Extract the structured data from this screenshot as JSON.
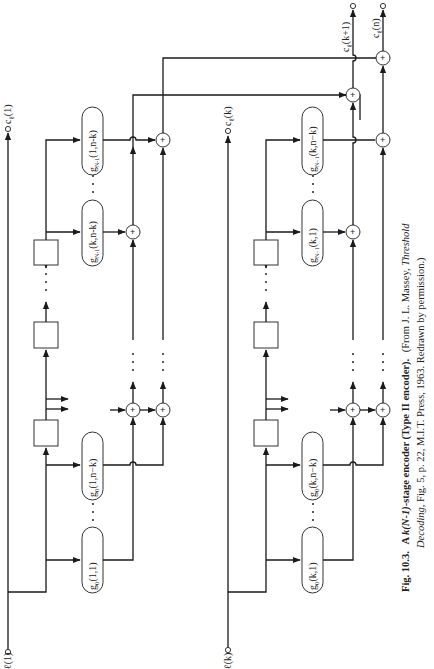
{
  "figure": {
    "orientation": "rotated-90-ccw",
    "caption": {
      "number": "Fig. 10.3.",
      "title_prefix": "A ",
      "title_italic": "k(N-1)",
      "title_suffix": "-stage encoder (Type II encoder).",
      "source_line1": "(From J. L. Massey, ",
      "source_line1_italic": "Threshold",
      "source_line2_italic": "Decoding",
      "source_line2": ", Fig. 5, p. 22, M.I.T. Press, 1963.  Redrawn by permission.)"
    }
  },
  "inputs": [
    {
      "id": "input-1",
      "label": "ℓ(1)"
    },
    {
      "id": "input-k",
      "label": "ℓ(k)"
    }
  ],
  "outputs": [
    {
      "id": "output-1",
      "label": "c_ℓ(1)",
      "base": "c",
      "sub": "ℓ",
      "arg": "(1)"
    },
    {
      "id": "output-k",
      "label": "c_ℓ(k)",
      "base": "c",
      "sub": "ℓ",
      "arg": "(k)"
    },
    {
      "id": "output-k1",
      "label": "c_ℓ(k+1)",
      "base": "c",
      "sub": "ℓ",
      "arg": "(k+1)"
    },
    {
      "id": "output-n",
      "label": "c_ℓ(n)",
      "base": "c",
      "sub": "ℓ",
      "arg": "(n)"
    }
  ],
  "generators": {
    "section1": [
      {
        "label": "g0(1,1)",
        "base": "g",
        "sub": "0",
        "arg": "(1,1)"
      },
      {
        "label": "g0(1,n−k)",
        "base": "g",
        "sub": "0",
        "arg": "(1,n−k)"
      },
      {
        "label": "gN-1(k,n-k)",
        "base": "g",
        "sub": "N-1",
        "arg": "(k,n-k)"
      },
      {
        "label": "gN-1(1,n-k)",
        "base": "g",
        "sub": "N-1",
        "arg": "(1,n-k)"
      }
    ],
    "section2": [
      {
        "label": "g0(k,1)",
        "base": "g",
        "sub": "0",
        "arg": "(k,1)"
      },
      {
        "label": "g0(k,n−k)",
        "base": "g",
        "sub": "0",
        "arg": "(k,n−k)"
      },
      {
        "label": "gN−1(k,1)",
        "base": "g",
        "sub": "N−1",
        "arg": "(k,1)"
      },
      {
        "label": "gN−1(k,n−k)",
        "base": "g",
        "sub": "N−1",
        "arg": "(k,n−k)"
      }
    ]
  },
  "symbols": {
    "adder": "+",
    "ellipsis": "· · ·"
  }
}
